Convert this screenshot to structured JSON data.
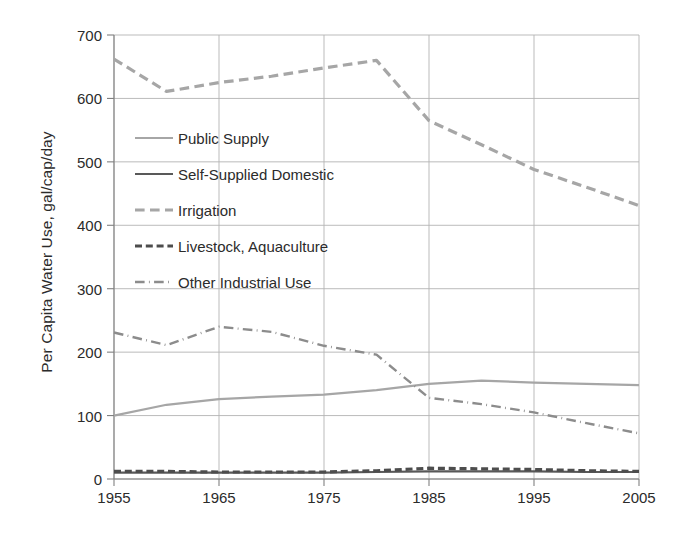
{
  "chart_data": {
    "type": "line",
    "title": "",
    "xlabel": "",
    "ylabel": "Per Capita Water Use, gal/cap/day",
    "xlim": [
      1955,
      2005
    ],
    "ylim": [
      0,
      700
    ],
    "grid": true,
    "legend_position": "inside-upper-left",
    "xticks": [
      "1955",
      "1965",
      "1975",
      "1985",
      "1995",
      "2005"
    ],
    "yticks": [
      "0",
      "100",
      "200",
      "300",
      "400",
      "500",
      "600",
      "700"
    ],
    "x": [
      1955,
      1960,
      1965,
      1970,
      1975,
      1980,
      1985,
      1990,
      1995,
      2000,
      2005
    ],
    "series": [
      {
        "name": "Public Supply",
        "style": "solid",
        "color": "#a6a6a6",
        "width": 2.2,
        "values": [
          100,
          117,
          126,
          130,
          133,
          140,
          150,
          155,
          152,
          150,
          148
        ]
      },
      {
        "name": "Self-Supplied Domestic",
        "style": "solid",
        "color": "#595959",
        "width": 2.2,
        "values": [
          10,
          10,
          10,
          10,
          10,
          11,
          12,
          12,
          12,
          11,
          11
        ]
      },
      {
        "name": "Irrigation",
        "style": "dashed",
        "color": "#a6a6a6",
        "width": 3.2,
        "values": [
          662,
          611,
          625,
          635,
          648,
          660,
          565,
          527,
          488,
          460,
          431
        ]
      },
      {
        "name": "Livestock, Aquaculture",
        "style": "dashed-bold",
        "color": "#4d4d4d",
        "width": 3.2,
        "values": [
          12,
          12,
          11,
          11,
          11,
          13,
          17,
          16,
          15,
          13,
          12
        ]
      },
      {
        "name": "Other Industrial Use",
        "style": "dash-dot",
        "color": "#8c8c8c",
        "width": 2.4,
        "values": [
          231,
          211,
          240,
          232,
          210,
          196,
          128,
          118,
          105,
          88,
          72
        ]
      }
    ]
  },
  "axes": {
    "y_title": "Per Capita Water Use, gal/cap/day"
  }
}
